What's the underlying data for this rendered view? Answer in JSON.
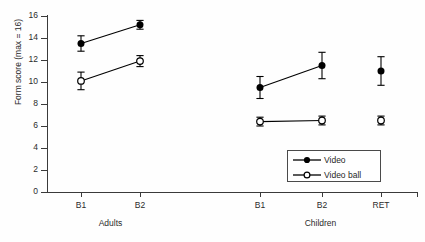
{
  "chart_data": {
    "type": "line",
    "title": "",
    "subtitle": "",
    "xlabel": "",
    "ylabel": "Form score (max = 16)",
    "ylim": [
      0,
      16
    ],
    "yticks": [
      0,
      2,
      4,
      6,
      8,
      10,
      12,
      14,
      16
    ],
    "grid": false,
    "legend_position": "inside-bottom-right",
    "groups": [
      {
        "name": "Adults",
        "categories": [
          "B1",
          "B2"
        ]
      },
      {
        "name": "Children",
        "categories": [
          "B1",
          "B2",
          "RET"
        ]
      }
    ],
    "categories": [
      "B1",
      "B2",
      "B1",
      "B2",
      "RET"
    ],
    "series": [
      {
        "name": "Video",
        "marker": "filled-circle",
        "values": [
          13.5,
          15.2,
          9.5,
          11.5,
          11.0
        ],
        "errors": [
          0.7,
          0.4,
          1.0,
          1.2,
          1.3
        ],
        "segments": [
          [
            0,
            1
          ],
          [
            2,
            3
          ]
        ]
      },
      {
        "name": "Video ball",
        "marker": "open-circle",
        "values": [
          10.1,
          11.9,
          6.4,
          6.5,
          6.5
        ],
        "errors": [
          0.8,
          0.5,
          0.4,
          0.4,
          0.4
        ],
        "segments": [
          [
            0,
            1
          ],
          [
            2,
            3
          ]
        ]
      }
    ],
    "annotations": []
  },
  "axes": {
    "y_title": "Form score (max = 16)",
    "y_tick_labels": [
      "16",
      "14",
      "12",
      "10",
      "8",
      "6",
      "4",
      "2",
      "0"
    ],
    "x_tick_labels": [
      "B1",
      "B2",
      "B1",
      "B2",
      "RET"
    ],
    "group_labels": [
      "Adults",
      "Children"
    ]
  },
  "legend": {
    "entries": [
      {
        "label": "Video",
        "marker": "filled-circle"
      },
      {
        "label": "Video ball",
        "marker": "open-circle"
      }
    ]
  },
  "colors": {
    "axis": "#3a3a3a",
    "marker": "#000000",
    "line": "#000000",
    "background": "#fefefe",
    "text": "#2b2b2b"
  }
}
